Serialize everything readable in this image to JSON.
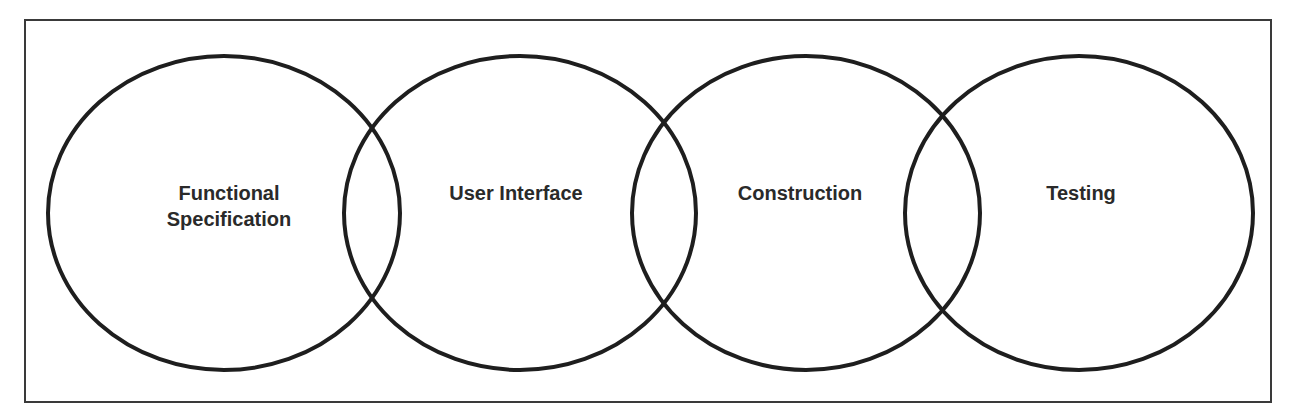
{
  "diagram": {
    "type": "overlapping-circles",
    "phases": [
      {
        "label_line1": "Functional",
        "label_line2": "Specification"
      },
      {
        "label_line1": "User Interface",
        "label_line2": ""
      },
      {
        "label_line1": "Construction",
        "label_line2": ""
      },
      {
        "label_line1": "Testing",
        "label_line2": ""
      }
    ],
    "colors": {
      "stroke": "#1e1e1e",
      "frame": "#3a3a3a",
      "text": "#2a2a2a",
      "background": "#ffffff"
    }
  }
}
